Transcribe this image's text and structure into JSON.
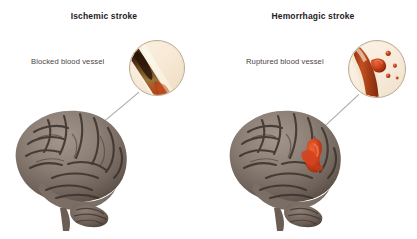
{
  "figure": {
    "background_color": "#ffffff",
    "width": 417,
    "height": 239
  },
  "panels": [
    {
      "id": "ischemic",
      "title": "Ischemic stroke",
      "vessel_label": "Blocked blood vessel",
      "magnifier": {
        "name": "blocked-vessel-closeup",
        "vessel_color": "#b2441d",
        "blockage_color": "#3b1c0c",
        "plasma_color": "#f7ead6",
        "border_color": "#b9aa93"
      },
      "brain": {
        "name": "brain-lateral-view",
        "tissue_color": "#8a7d74",
        "sulci_color": "#3d332c",
        "lesion": null
      }
    },
    {
      "id": "hemorrhagic",
      "title": "Hemorrhagic stroke",
      "vessel_label": "Ruptured blood vessel",
      "magnifier": {
        "name": "ruptured-vessel-closeup",
        "vessel_color": "#b2441d",
        "droplet_color": "#c8401a",
        "plasma_color": "#f7ead6",
        "border_color": "#b9aa93",
        "droplet_count": 4
      },
      "brain": {
        "name": "brain-lateral-view",
        "tissue_color": "#8a7d74",
        "sulci_color": "#3d332c",
        "lesion": {
          "name": "hemorrhage-lesion",
          "color": "#d4431f"
        }
      }
    }
  ],
  "leader_lines": {
    "color": "#a9a6a4",
    "count": 2
  }
}
